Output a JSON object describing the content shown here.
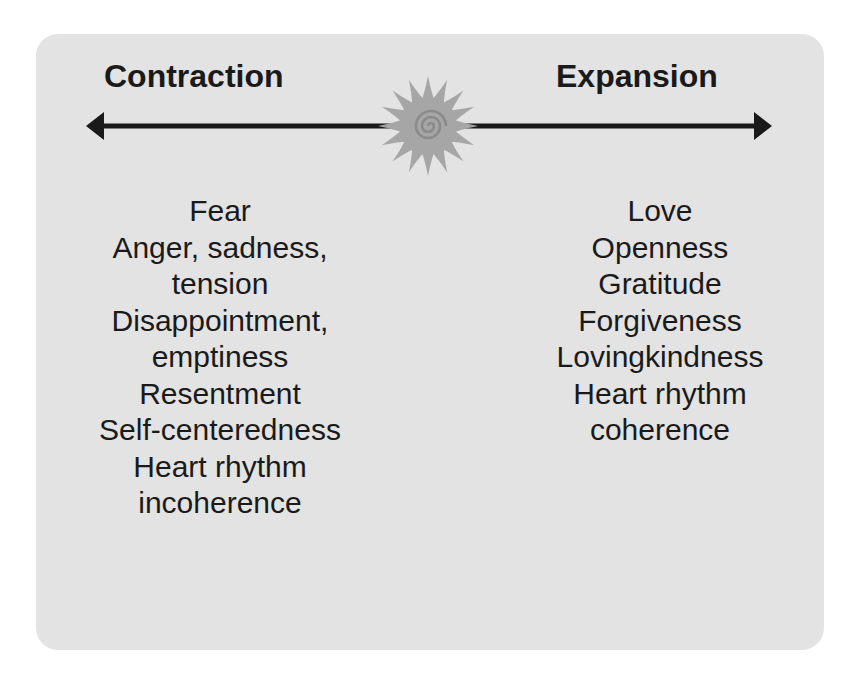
{
  "diagram": {
    "left": {
      "heading": "Contraction",
      "lines": [
        "Fear",
        "Anger, sadness,",
        "tension",
        "Disappointment,",
        "emptiness",
        "Resentment",
        "Self-centeredness",
        "Heart rhythm",
        "incoherence"
      ]
    },
    "right": {
      "heading": "Expansion",
      "lines": [
        "Love",
        "Openness",
        "Gratitude",
        "Forgiveness",
        "Lovingkindness",
        "Heart rhythm",
        "coherence"
      ]
    },
    "center_icon": "sun-spiral-icon",
    "colors": {
      "panel": "#e3e3e3",
      "text": "#1a1a1a",
      "sun": "#a6a6a6"
    }
  }
}
